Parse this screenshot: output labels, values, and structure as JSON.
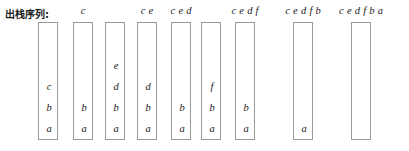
{
  "caption": {
    "text": "出栈序列:"
  },
  "geometry": {
    "box_width": 20,
    "box_height": 118,
    "box_top": 22,
    "cell_height": 21
  },
  "columns": [
    {
      "id": "stack-state-1",
      "left": 38,
      "pop_sequence": "",
      "contents": [
        "a",
        "b",
        "c"
      ]
    },
    {
      "id": "stack-state-2",
      "left": 73,
      "pop_sequence": "c",
      "contents": [
        "a",
        "b"
      ]
    },
    {
      "id": "stack-state-3",
      "left": 105,
      "pop_sequence": "",
      "contents": [
        "a",
        "b",
        "d",
        "e"
      ]
    },
    {
      "id": "stack-state-4",
      "left": 137,
      "pop_sequence": "c e",
      "contents": [
        "a",
        "b",
        "d"
      ]
    },
    {
      "id": "stack-state-5",
      "left": 171,
      "pop_sequence": "c e d",
      "contents": [
        "a",
        "b"
      ]
    },
    {
      "id": "stack-state-6",
      "left": 201,
      "pop_sequence": "",
      "contents": [
        "a",
        "b",
        "f"
      ]
    },
    {
      "id": "stack-state-7",
      "left": 235,
      "pop_sequence": "c e d f",
      "contents": [
        "a",
        "b"
      ]
    },
    {
      "id": "stack-state-8",
      "left": 293,
      "pop_sequence": "c e d f b",
      "contents": [
        "a"
      ]
    },
    {
      "id": "stack-state-9",
      "left": 351,
      "pop_sequence": "c e d f b a",
      "contents": []
    }
  ]
}
